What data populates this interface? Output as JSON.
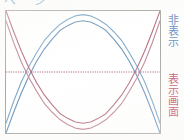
{
  "figure": {
    "top_caption_cut": "ページ",
    "labels": {
      "hidden_region": "非表示",
      "display_region": "表示画面"
    },
    "colors": {
      "curve_blue": "#7fa8c6",
      "curve_blue_2": "#6d95bd",
      "curve_red": "#c08b9a",
      "curve_red_2": "#b5717f",
      "midline": "#a8697e",
      "frame": "#a9a9a4",
      "label_blue": "#6f93c4",
      "label_red": "#c4566f",
      "background": "#ffffff"
    }
  },
  "chart_data": {
    "type": "line",
    "title": "",
    "xlabel": "",
    "ylabel": "",
    "xlim": [
      0,
      100
    ],
    "ylim": [
      0,
      100
    ],
    "grid": false,
    "legend_position": "right-outside",
    "annotations": [
      {
        "text": "非表示",
        "position": "right-upper",
        "color": "#6f93c4"
      },
      {
        "text": "表示画面",
        "position": "right-lower",
        "color": "#c4566f"
      }
    ],
    "midline": {
      "y": 50,
      "style": "dotted",
      "color": "#a8697e"
    },
    "x": [
      0,
      5,
      10,
      15,
      20,
      25,
      30,
      35,
      40,
      45,
      50,
      55,
      60,
      65,
      70,
      75,
      80,
      85,
      90,
      95,
      100
    ],
    "series": [
      {
        "name": "blue-arc-outer",
        "color": "#7fa8c6",
        "values": [
          8,
          26,
          42,
          55,
          66,
          76,
          83,
          89,
          93,
          96,
          97,
          96,
          93,
          89,
          83,
          76,
          66,
          55,
          42,
          26,
          8
        ]
      },
      {
        "name": "blue-arc-inner",
        "color": "#6d95bd",
        "values": [
          0,
          17,
          33,
          47,
          59,
          69,
          77,
          84,
          88,
          91,
          92,
          91,
          88,
          84,
          77,
          69,
          59,
          47,
          33,
          17,
          0
        ]
      },
      {
        "name": "red-arc-outer",
        "color": "#c08b9a",
        "values": [
          92,
          74,
          58,
          45,
          34,
          24,
          17,
          11,
          7,
          4,
          3,
          4,
          7,
          11,
          17,
          24,
          34,
          45,
          58,
          74,
          92
        ]
      },
      {
        "name": "red-arc-inner",
        "color": "#b5717f",
        "values": [
          100,
          83,
          67,
          53,
          41,
          31,
          23,
          16,
          12,
          9,
          8,
          9,
          12,
          16,
          23,
          31,
          41,
          53,
          67,
          83,
          100
        ]
      }
    ]
  }
}
